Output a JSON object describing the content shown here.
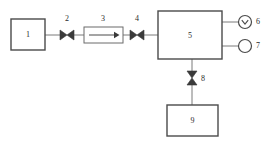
{
  "diagram": {
    "type": "process-flow-schematic",
    "background_color": "#ffffff",
    "line_color": "#7a7a7a",
    "box_stroke_color": "#4a4a4a",
    "symbol_fill_color": "#3a3a3a",
    "label_color": "#2b2b2b",
    "components": [
      {
        "id": "1",
        "label": "1",
        "symbol": "rectangle-vessel",
        "name": "component-1-vessel"
      },
      {
        "id": "2",
        "label": "2",
        "symbol": "gate-valve-horizontal",
        "name": "component-2-valve"
      },
      {
        "id": "3",
        "label": "3",
        "symbol": "flow-meter-with-arrow",
        "name": "component-3-flowmeter"
      },
      {
        "id": "4",
        "label": "4",
        "symbol": "gate-valve-horizontal",
        "name": "component-4-valve"
      },
      {
        "id": "5",
        "label": "5",
        "symbol": "rectangle-vessel",
        "name": "component-5-vessel"
      },
      {
        "id": "6",
        "label": "6",
        "symbol": "gauge-circle-with-chevron",
        "name": "component-6-gauge"
      },
      {
        "id": "7",
        "label": "7",
        "symbol": "circle-port",
        "name": "component-7-port"
      },
      {
        "id": "8",
        "label": "8",
        "symbol": "gate-valve-vertical",
        "name": "component-8-valve"
      },
      {
        "id": "9",
        "label": "9",
        "symbol": "rectangle-vessel",
        "name": "component-9-vessel"
      }
    ],
    "flow_arrow": {
      "direction": "left-to-right",
      "name": "flow-direction-arrow"
    }
  }
}
